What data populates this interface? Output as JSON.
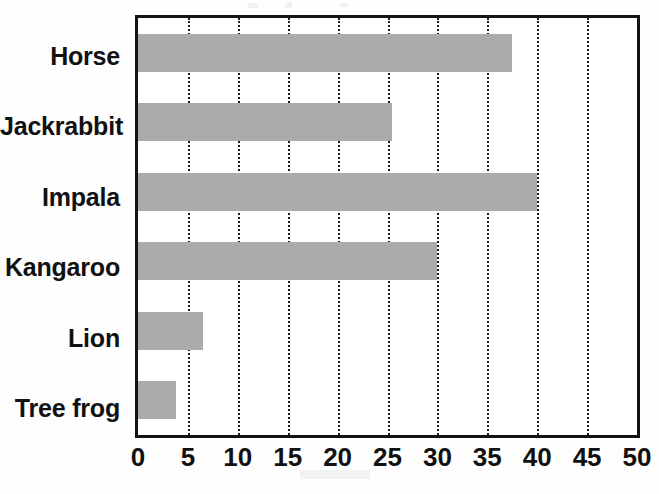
{
  "chart_data": {
    "type": "bar",
    "orientation": "horizontal",
    "title": "",
    "subtitle": "",
    "xlabel": "",
    "ylabel": "",
    "categories": [
      "Horse",
      "Jackrabbit",
      "Impala",
      "Kangaroo",
      "Lion",
      "Tree frog"
    ],
    "values": [
      37.5,
      25.5,
      40,
      30,
      6.5,
      3.8
    ],
    "series": [
      {
        "name": "Maximum speed",
        "values": [
          37.5,
          25.5,
          40,
          30,
          6.5,
          3.8
        ]
      }
    ],
    "xlim": [
      0,
      50
    ],
    "ylim": null,
    "xticks": [
      0,
      5,
      10,
      15,
      20,
      25,
      30,
      35,
      40,
      45,
      50
    ],
    "xtick_labels": [
      "0",
      "5",
      "10",
      "15",
      "20",
      "25",
      "30",
      "35",
      "40",
      "45",
      "50"
    ],
    "grid": "vertical-dotted",
    "legend": "none",
    "bar_color": "#ababab",
    "axis_color": "#141414",
    "gridline_color": "#1b1b1b",
    "background_color": "#ffffff",
    "annotations": []
  },
  "axis": {
    "x_min_label": "0",
    "x_max_label": "50"
  }
}
